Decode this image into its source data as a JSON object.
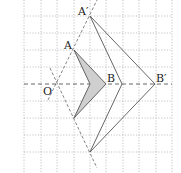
{
  "diagram": {
    "labels": {
      "O": "O",
      "A": "A",
      "B": "B",
      "A_prime": "A′",
      "B_prime": "B′"
    },
    "grid": {
      "cols_x": [
        24,
        41,
        57,
        74,
        90,
        106,
        123,
        139,
        156,
        172
      ],
      "rows_y": [
        16,
        33,
        50,
        67,
        84,
        101,
        118,
        135,
        152
      ]
    },
    "colors": {
      "line": "#555555",
      "grid": "#999999",
      "fill": "#cfcfcf"
    }
  }
}
